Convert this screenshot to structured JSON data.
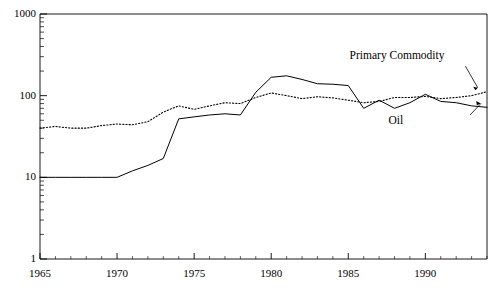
{
  "chart_data": {
    "type": "line",
    "title": "",
    "subtitle": "",
    "xlabel": "",
    "ylabel": "",
    "yscale": "log",
    "ylim": [
      1,
      1000
    ],
    "xlim": [
      1965,
      1994
    ],
    "grid": false,
    "legend_position": "inline-annotation",
    "y_ticks": [
      "1",
      "10",
      "100",
      "1000"
    ],
    "y_tick_values": [
      1,
      10,
      100,
      1000
    ],
    "x_ticks": [
      "1965",
      "1970",
      "1975",
      "1980",
      "1985",
      "1990"
    ],
    "x_tick_values": [
      1965,
      1970,
      1975,
      1980,
      1985,
      1990
    ],
    "annotations": [
      {
        "name": "primary-commodity-label",
        "text": "Primary Commodity",
        "x": 1988.2,
        "y": 300
      },
      {
        "name": "oil-label",
        "text": "Oil",
        "x": 1988.0,
        "y": 48
      }
    ],
    "series": [
      {
        "name": "Oil",
        "style": "solid",
        "x": [
          1965,
          1966,
          1967,
          1968,
          1969,
          1970,
          1971,
          1972,
          1973,
          1974,
          1975,
          1976,
          1977,
          1978,
          1979,
          1980,
          1981,
          1982,
          1983,
          1984,
          1985,
          1986,
          1987,
          1988,
          1989,
          1990,
          1991,
          1992,
          1993,
          1994
        ],
        "values": [
          10,
          10,
          10,
          10,
          10,
          10,
          12,
          14,
          17,
          52,
          55,
          58,
          60,
          58,
          110,
          168,
          175,
          158,
          140,
          138,
          133,
          70,
          88,
          70,
          82,
          104,
          85,
          82,
          75,
          72
        ]
      },
      {
        "name": "Primary Commodity",
        "style": "dotted",
        "x": [
          1965,
          1966,
          1967,
          1968,
          1969,
          1970,
          1971,
          1972,
          1973,
          1974,
          1975,
          1976,
          1977,
          1978,
          1979,
          1980,
          1981,
          1982,
          1983,
          1984,
          1985,
          1986,
          1987,
          1988,
          1989,
          1990,
          1991,
          1992,
          1993,
          1994
        ],
        "values": [
          40,
          42,
          40,
          40,
          43,
          45,
          44,
          48,
          63,
          75,
          68,
          75,
          82,
          80,
          95,
          108,
          100,
          92,
          97,
          94,
          88,
          82,
          85,
          95,
          95,
          98,
          92,
          95,
          100,
          112
        ]
      }
    ]
  }
}
